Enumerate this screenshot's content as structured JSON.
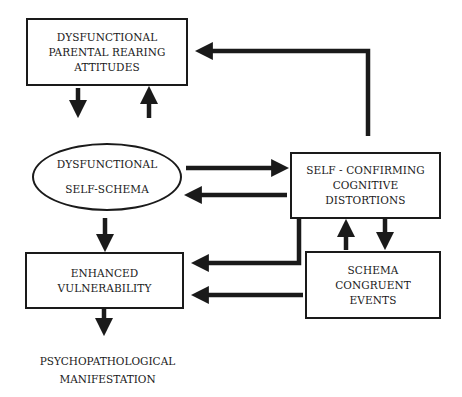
{
  "diagram": {
    "nodes": {
      "parental": {
        "lines": [
          "DYSFUNCTIONAL",
          "PARENTAL REARING",
          "ATTITUDES"
        ],
        "shape": "rectangle"
      },
      "self_schema": {
        "lines": [
          "DYSFUNCTIONAL",
          "SELF-SCHEMA"
        ],
        "shape": "ellipse"
      },
      "distortions": {
        "lines": [
          "SELF - CONFIRMING",
          "COGNITIVE",
          "DISTORTIONS"
        ],
        "shape": "rectangle"
      },
      "vulnerability": {
        "lines": [
          "ENHANCED",
          "VULNERABILITY"
        ],
        "shape": "rectangle"
      },
      "events": {
        "lines": [
          "SCHEMA",
          "CONGRUENT",
          "EVENTS"
        ],
        "shape": "rectangle"
      },
      "manifestation": {
        "lines": [
          "PSYCHOPATHOLOGICAL",
          "MANIFESTATION"
        ],
        "shape": "none"
      }
    },
    "edges": [
      {
        "from": "parental",
        "to": "self_schema"
      },
      {
        "from": "self_schema",
        "to": "parental"
      },
      {
        "from": "distortions",
        "to": "parental"
      },
      {
        "from": "self_schema",
        "to": "distortions"
      },
      {
        "from": "distortions",
        "to": "self_schema"
      },
      {
        "from": "self_schema",
        "to": "vulnerability"
      },
      {
        "from": "distortions",
        "to": "vulnerability"
      },
      {
        "from": "events",
        "to": "vulnerability"
      },
      {
        "from": "events",
        "to": "distortions"
      },
      {
        "from": "distortions",
        "to": "events"
      },
      {
        "from": "vulnerability",
        "to": "manifestation"
      }
    ],
    "colors": {
      "stroke": "#1a1a1a",
      "background": "#ffffff"
    }
  }
}
